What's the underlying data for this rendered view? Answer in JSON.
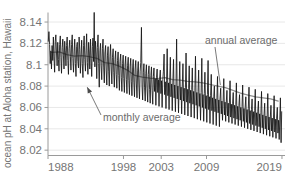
{
  "chart_data": {
    "type": "line",
    "title": "",
    "xlabel": "",
    "ylabel": "ocean pH at Aloha station, Hawaii",
    "ylim": [
      8.015,
      8.148
    ],
    "xlim": [
      1988,
      2019.4
    ],
    "grid": true,
    "legend_position": "inline-annotations",
    "y_ticks": [
      "8.02",
      "8.04",
      "8.06",
      "8.08",
      "8.1",
      "8.12",
      "8.14"
    ],
    "y_tick_values": [
      8.02,
      8.04,
      8.06,
      8.08,
      8.1,
      8.12,
      8.14
    ],
    "x_ticks": [
      "1988",
      "1998",
      "2003",
      "2009",
      "2019"
    ],
    "x_tick_values": [
      1988,
      1998,
      2003,
      2009,
      2019
    ],
    "annotations": [
      {
        "id": "annual-average",
        "text": "annual average",
        "points_to": "annual average gray curve",
        "x": 2011.5,
        "y": 8.081
      },
      {
        "id": "monthly-average",
        "text": "monthly average",
        "points_to": "monthly average black trace",
        "x": 1993.2,
        "y": 8.079
      }
    ],
    "series": [
      {
        "name": "monthly average",
        "color": "#141414",
        "x": [
          1988.04,
          1988.12,
          1988.21,
          1988.29,
          1988.38,
          1988.46,
          1988.54,
          1988.63,
          1988.71,
          1988.79,
          1988.88,
          1988.96,
          1989.04,
          1989.12,
          1989.21,
          1989.29,
          1989.38,
          1989.46,
          1989.54,
          1989.63,
          1989.71,
          1989.79,
          1989.88,
          1989.96,
          1990.04,
          1990.12,
          1990.21,
          1990.29,
          1990.38,
          1990.46,
          1990.54,
          1990.63,
          1990.71,
          1990.79,
          1990.88,
          1990.96,
          1991.04,
          1991.12,
          1991.21,
          1991.29,
          1991.38,
          1991.46,
          1991.54,
          1991.63,
          1991.71,
          1991.79,
          1991.88,
          1991.96,
          1992.04,
          1992.12,
          1992.21,
          1992.29,
          1992.38,
          1992.46,
          1992.54,
          1992.63,
          1992.71,
          1992.79,
          1992.88,
          1992.96,
          1993.04,
          1993.12,
          1993.21,
          1993.29,
          1993.38,
          1993.46,
          1993.54,
          1993.63,
          1993.71,
          1993.79,
          1993.88,
          1993.96,
          1994.04,
          1994.12,
          1994.21,
          1994.29,
          1994.38,
          1994.46,
          1994.54,
          1994.63,
          1994.71,
          1994.79,
          1994.88,
          1994.96,
          1995.04,
          1995.12,
          1995.21,
          1995.29,
          1995.38,
          1995.46,
          1995.54,
          1995.63,
          1995.71,
          1995.79,
          1995.88,
          1995.96,
          1996.04,
          1996.12,
          1996.21,
          1996.29,
          1996.38,
          1996.46,
          1996.54,
          1996.63,
          1996.71,
          1996.79,
          1996.88,
          1996.96,
          1997.04,
          1997.12,
          1997.21,
          1997.29,
          1997.38,
          1997.46,
          1997.54,
          1997.63,
          1997.71,
          1997.79,
          1997.88,
          1997.96,
          1998.04,
          1998.12,
          1998.21,
          1998.29,
          1998.38,
          1998.46,
          1998.54,
          1998.63,
          1998.71,
          1998.79,
          1998.88,
          1998.96,
          1999.04,
          1999.12,
          1999.21,
          1999.29,
          1999.38,
          1999.46,
          1999.54,
          1999.63,
          1999.71,
          1999.79,
          1999.88,
          1999.96,
          2000.04,
          2000.12,
          2000.21,
          2000.29,
          2000.38,
          2000.46,
          2000.54,
          2000.63,
          2000.71,
          2000.79,
          2000.88,
          2000.96,
          2001.04,
          2001.12,
          2001.21,
          2001.29,
          2001.38,
          2001.46,
          2001.54,
          2001.63,
          2001.71,
          2001.79,
          2001.88,
          2001.96,
          2002.04,
          2002.12,
          2002.21,
          2002.29,
          2002.38,
          2002.46,
          2002.54,
          2002.63,
          2002.71,
          2002.79,
          2002.88,
          2002.96,
          2003.04,
          2003.12,
          2003.21,
          2003.29,
          2003.38,
          2003.46,
          2003.54,
          2003.63,
          2003.71,
          2003.79,
          2003.88,
          2003.96,
          2004.04,
          2004.12,
          2004.21,
          2004.29,
          2004.38,
          2004.46,
          2004.54,
          2004.63,
          2004.71,
          2004.79,
          2004.88,
          2004.96,
          2005.04,
          2005.12,
          2005.21,
          2005.29,
          2005.38,
          2005.46,
          2005.54,
          2005.63,
          2005.71,
          2005.79,
          2005.88,
          2005.96,
          2006.04,
          2006.12,
          2006.21,
          2006.29,
          2006.38,
          2006.46,
          2006.54,
          2006.63,
          2006.71,
          2006.79,
          2006.88,
          2006.96,
          2007.04,
          2007.12,
          2007.21,
          2007.29,
          2007.38,
          2007.46,
          2007.54,
          2007.63,
          2007.71,
          2007.79,
          2007.88,
          2007.96,
          2008.04,
          2008.12,
          2008.21,
          2008.29,
          2008.38,
          2008.46,
          2008.54,
          2008.63,
          2008.71,
          2008.79,
          2008.88,
          2008.96,
          2009.04,
          2009.12,
          2009.21,
          2009.29,
          2009.38,
          2009.46,
          2009.54,
          2009.63,
          2009.71,
          2009.79,
          2009.88,
          2009.96,
          2010.04,
          2010.12,
          2010.21,
          2010.29,
          2010.38,
          2010.46,
          2010.54,
          2010.63,
          2010.71,
          2010.79,
          2010.88,
          2010.96,
          2011.04,
          2011.12,
          2011.21,
          2011.29,
          2011.38,
          2011.46,
          2011.54,
          2011.63,
          2011.71,
          2011.79,
          2011.88,
          2011.96,
          2012.04,
          2012.12,
          2012.21,
          2012.29,
          2012.38,
          2012.46,
          2012.54,
          2012.63,
          2012.71,
          2012.79,
          2012.88,
          2012.96,
          2013.04,
          2013.12,
          2013.21,
          2013.29,
          2013.38,
          2013.46,
          2013.54,
          2013.63,
          2013.71,
          2013.79,
          2013.88,
          2013.96,
          2014.04,
          2014.12,
          2014.21,
          2014.29,
          2014.38,
          2014.46,
          2014.54,
          2014.63,
          2014.71,
          2014.79,
          2014.88,
          2014.96,
          2015.04,
          2015.12,
          2015.21,
          2015.29,
          2015.38,
          2015.46,
          2015.54,
          2015.63,
          2015.71,
          2015.79,
          2015.88,
          2015.96,
          2016.04,
          2016.12,
          2016.21,
          2016.29,
          2016.38,
          2016.46,
          2016.54,
          2016.63,
          2016.71,
          2016.79,
          2016.88,
          2016.96,
          2017.04,
          2017.12,
          2017.21,
          2017.29,
          2017.38,
          2017.46,
          2017.54,
          2017.63,
          2017.71,
          2017.79,
          2017.88,
          2017.96,
          2018.04,
          2018.12,
          2018.21,
          2018.29,
          2018.38,
          2018.46,
          2018.54,
          2018.63,
          2018.71,
          2018.79,
          2018.88,
          2018.96
        ],
        "y": [
          8.122,
          8.131,
          8.119,
          8.101,
          8.113,
          8.096,
          8.118,
          8.104,
          8.126,
          8.108,
          8.093,
          8.122,
          8.128,
          8.112,
          8.099,
          8.121,
          8.105,
          8.094,
          8.119,
          8.127,
          8.107,
          8.092,
          8.116,
          8.124,
          8.109,
          8.096,
          8.122,
          8.113,
          8.099,
          8.118,
          8.126,
          8.104,
          8.091,
          8.115,
          8.123,
          8.108,
          8.095,
          8.119,
          8.128,
          8.106,
          8.093,
          8.112,
          8.124,
          8.101,
          8.089,
          8.117,
          8.121,
          8.103,
          8.097,
          8.126,
          8.114,
          8.092,
          8.109,
          8.123,
          8.101,
          8.088,
          8.118,
          8.127,
          8.105,
          8.094,
          8.113,
          8.129,
          8.102,
          8.091,
          8.121,
          8.112,
          8.096,
          8.124,
          8.106,
          8.089,
          8.117,
          8.125,
          8.103,
          8.149,
          8.098,
          8.122,
          8.11,
          8.087,
          8.116,
          8.128,
          8.101,
          8.079,
          8.113,
          8.12,
          8.099,
          8.086,
          8.115,
          8.124,
          8.097,
          8.083,
          8.111,
          8.118,
          8.095,
          8.081,
          8.109,
          8.117,
          8.094,
          8.08,
          8.108,
          8.119,
          8.096,
          8.082,
          8.107,
          8.115,
          8.093,
          8.079,
          8.105,
          8.113,
          8.091,
          8.078,
          8.104,
          8.112,
          8.09,
          8.076,
          8.103,
          8.11,
          8.088,
          8.075,
          8.101,
          8.109,
          8.087,
          8.074,
          8.1,
          8.108,
          8.086,
          8.073,
          8.099,
          8.107,
          8.085,
          8.072,
          8.098,
          8.106,
          8.084,
          8.071,
          8.097,
          8.105,
          8.083,
          8.07,
          8.096,
          8.104,
          8.082,
          8.069,
          8.095,
          8.103,
          8.081,
          8.068,
          8.094,
          8.102,
          8.135,
          8.08,
          8.067,
          8.093,
          8.101,
          8.079,
          8.066,
          8.092,
          8.1,
          8.078,
          8.065,
          8.091,
          8.099,
          8.077,
          8.064,
          8.09,
          8.098,
          8.076,
          8.063,
          8.089,
          8.097,
          8.075,
          8.087,
          8.062,
          8.088,
          8.096,
          8.074,
          8.086,
          8.061,
          8.087,
          8.095,
          8.073,
          8.085,
          8.06,
          8.086,
          8.094,
          8.11,
          8.072,
          8.084,
          8.059,
          8.085,
          8.115,
          8.071,
          8.083,
          8.058,
          8.084,
          8.107,
          8.07,
          8.082,
          8.057,
          8.083,
          8.105,
          8.069,
          8.081,
          8.056,
          8.082,
          8.124,
          8.068,
          8.08,
          8.055,
          8.081,
          8.103,
          8.067,
          8.079,
          8.054,
          8.08,
          8.101,
          8.066,
          8.078,
          8.053,
          8.079,
          8.111,
          8.065,
          8.077,
          8.052,
          8.078,
          8.099,
          8.064,
          8.076,
          8.051,
          8.077,
          8.097,
          8.063,
          8.075,
          8.05,
          8.076,
          8.108,
          8.062,
          8.074,
          8.049,
          8.075,
          8.095,
          8.061,
          8.073,
          8.048,
          8.074,
          8.106,
          8.06,
          8.072,
          8.047,
          8.073,
          8.093,
          8.059,
          8.071,
          8.046,
          8.072,
          8.104,
          8.058,
          8.07,
          8.045,
          8.071,
          8.091,
          8.057,
          8.069,
          8.044,
          8.07,
          8.08,
          8.056,
          8.068,
          8.043,
          8.069,
          8.089,
          8.055,
          8.067,
          8.042,
          8.068,
          8.078,
          8.054,
          8.066,
          8.048,
          8.067,
          8.087,
          8.053,
          8.065,
          8.047,
          8.066,
          8.076,
          8.052,
          8.064,
          8.046,
          8.065,
          8.085,
          8.051,
          8.063,
          8.045,
          8.064,
          8.074,
          8.05,
          8.062,
          8.044,
          8.063,
          8.083,
          8.049,
          8.061,
          8.043,
          8.062,
          8.072,
          8.048,
          8.06,
          8.042,
          8.061,
          8.081,
          8.047,
          8.059,
          8.041,
          8.06,
          8.07,
          8.046,
          8.058,
          8.04,
          8.059,
          8.079,
          8.045,
          8.057,
          8.039,
          8.058,
          8.068,
          8.044,
          8.056,
          8.038,
          8.057,
          8.077,
          8.043,
          8.055,
          8.037,
          8.056,
          8.066,
          8.042,
          8.054,
          8.036,
          8.055,
          8.075,
          8.041,
          8.053,
          8.035,
          8.054,
          8.064,
          8.04,
          8.052,
          8.034,
          8.053,
          8.073,
          8.039,
          8.051,
          8.033,
          8.052,
          8.062,
          8.038,
          8.05,
          8.032,
          8.051,
          8.071,
          8.037,
          8.049,
          8.031,
          8.05,
          8.06,
          8.036,
          8.048,
          8.03,
          8.049,
          8.069,
          8.027,
          8.056
        ]
      },
      {
        "name": "annual average",
        "color": "#8e8e8e",
        "x": [
          1988.5,
          1989.5,
          1990.5,
          1991.5,
          1992.5,
          1993.5,
          1994.5,
          1995.5,
          1996.5,
          1997.5,
          1998.5,
          1999.5,
          2000.5,
          2001.5,
          2002.5,
          2003.5,
          2004.5,
          2005.5,
          2006.5,
          2007.5,
          2008.5,
          2009.5,
          2010.5,
          2011.5,
          2012.5,
          2013.5,
          2014.5,
          2015.5,
          2016.5,
          2017.5,
          2018.5
        ],
        "y": [
          8.1115,
          8.112,
          8.1095,
          8.108,
          8.1085,
          8.1075,
          8.106,
          8.102,
          8.101,
          8.0985,
          8.095,
          8.09,
          8.0885,
          8.0875,
          8.087,
          8.088,
          8.086,
          8.0855,
          8.0845,
          8.084,
          8.083,
          8.0815,
          8.08,
          8.0785,
          8.076,
          8.0735,
          8.0715,
          8.07,
          8.069,
          8.068,
          8.066
        ]
      }
    ]
  }
}
